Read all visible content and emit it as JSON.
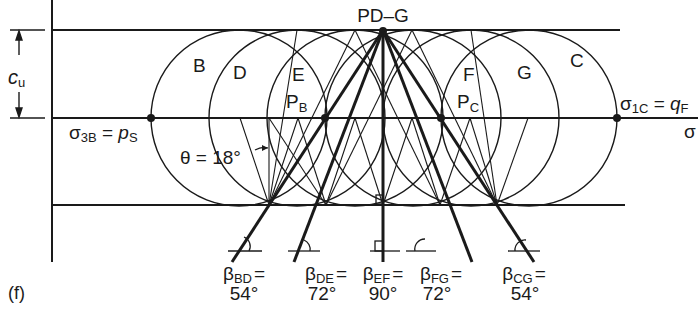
{
  "figure_label": "(f)",
  "pole_label": "PD–G",
  "axis": {
    "sigma_label": "σ",
    "cu_label": "c",
    "cu_sub": "u"
  },
  "circles": [
    {
      "id": "B",
      "label": "B",
      "cx": 239
    },
    {
      "id": "D",
      "label": "D",
      "cx": 297
    },
    {
      "id": "E",
      "label": "E",
      "cx": 355
    },
    {
      "id": "F",
      "label": "F",
      "cx": 413
    },
    {
      "id": "G",
      "label": "G",
      "cx": 471
    },
    {
      "id": "C",
      "label": "C",
      "cx": 529
    }
  ],
  "points": {
    "pb": {
      "main": "P",
      "sub": "B"
    },
    "pc": {
      "main": "P",
      "sub": "C"
    },
    "sigma3b": {
      "main": "σ",
      "sub": "3B",
      "eq": " = ",
      "rhs": "p",
      "rhs_sub": "S"
    },
    "sigma1c": {
      "main": "σ",
      "sub": "1C",
      "eq": " = ",
      "rhs": "q",
      "rhs_sub": "F"
    }
  },
  "theta_label": "θ = 18°",
  "betas": [
    {
      "sub": "BD",
      "value": "54°"
    },
    {
      "sub": "DE",
      "value": "72°"
    },
    {
      "sub": "EF",
      "value": "90°"
    },
    {
      "sub": "FG",
      "value": "72°"
    },
    {
      "sub": "CG",
      "value": "54°"
    }
  ],
  "beta_symbol": "β",
  "equals": "="
}
